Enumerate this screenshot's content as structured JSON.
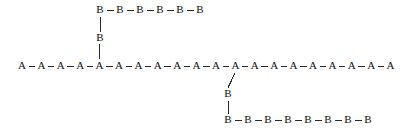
{
  "diagram": {
    "type": "graft-copolymer-chain-diagram",
    "canvas": {
      "width": 408,
      "height": 133,
      "background": "#ffffff"
    },
    "style": {
      "node_color": "#111111",
      "bond_color": "#2a2a2a",
      "node_font_size": 11,
      "bond_width": 1
    },
    "backbone": {
      "label": "main-chain",
      "unit_label": "A",
      "count": 20,
      "start_x": 22,
      "spacing_x": 19.4,
      "y": 66
    },
    "branches": [
      {
        "label": "upper-graft",
        "unit_label": "B",
        "attach_backbone_index": 4,
        "stem_nodes": [
          {
            "label": "B",
            "x": 100,
            "y": 38
          }
        ],
        "chain": {
          "count": 6,
          "start_x": 100,
          "spacing_x": 20,
          "y": 10
        }
      },
      {
        "label": "lower-graft",
        "unit_label": "B",
        "attach_backbone_index": 11,
        "stem_nodes": [
          {
            "label": "B",
            "x": 228,
            "y": 94
          }
        ],
        "chain": {
          "count": 8,
          "start_x": 228,
          "spacing_x": 20,
          "y": 120
        }
      }
    ]
  }
}
